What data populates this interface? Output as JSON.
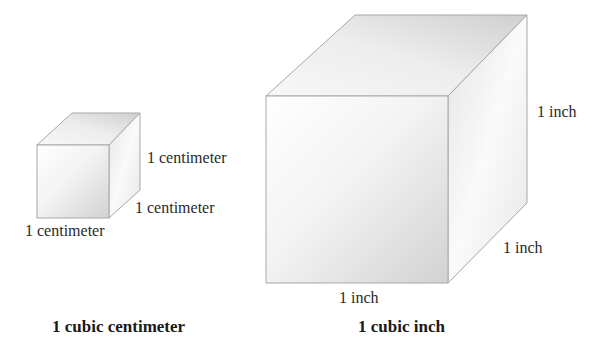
{
  "small_cube": {
    "height_label": "1 centimeter",
    "depth_label": "1 centimeter",
    "width_label": "1 centimeter",
    "caption": "1 cubic centimeter"
  },
  "large_cube": {
    "height_label": "1 inch",
    "depth_label": "1 inch",
    "width_label": "1 inch",
    "caption": "1 cubic inch"
  },
  "colors": {
    "edge": "#a8a8a8",
    "face_light": "#ffffff",
    "face_dark": "#d4d4d4",
    "text": "#2a2a2a"
  }
}
